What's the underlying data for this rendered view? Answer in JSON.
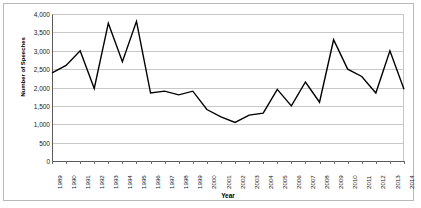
{
  "chart_data": {
    "type": "line",
    "title": "",
    "xlabel": "Year",
    "ylabel": "Number of Speeches",
    "categories": [
      "1989",
      "1990",
      "1991",
      "1992",
      "1993",
      "1994",
      "1995",
      "1996",
      "1997",
      "1998",
      "1999",
      "2000",
      "2001",
      "2002",
      "2003",
      "2004",
      "2005",
      "2006",
      "2007",
      "2008",
      "2009",
      "2010",
      "2011",
      "2012",
      "2013",
      "2014"
    ],
    "values": [
      2400,
      2600,
      3000,
      1975,
      3750,
      2700,
      3800,
      1850,
      1900,
      1800,
      1900,
      1400,
      1200,
      1050,
      1250,
      1300,
      1950,
      1500,
      2150,
      1600,
      3300,
      2500,
      2300,
      1850,
      3000,
      1950
    ],
    "ylim": [
      0,
      4000
    ],
    "y_ticks": [
      "0",
      "500",
      "1,000",
      "1,500",
      "2,000",
      "2,500",
      "3,000",
      "3,500",
      "4,000"
    ],
    "y_tick_values": [
      0,
      500,
      1000,
      1500,
      2000,
      2500,
      3000,
      3500,
      4000
    ],
    "grid": true,
    "legend": false,
    "series_color": "#000000"
  }
}
